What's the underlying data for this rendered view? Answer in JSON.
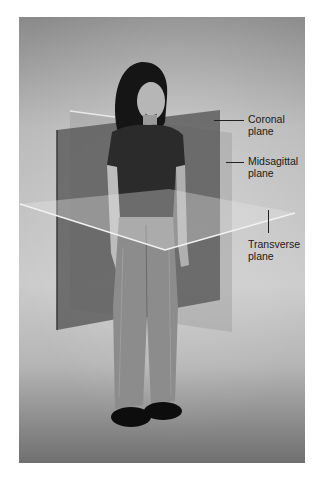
{
  "figure": {
    "labels": {
      "coronal": {
        "line1": "Coronal",
        "line2": "plane"
      },
      "midsagittal": {
        "line1": "Midsagittal",
        "line2": "plane"
      },
      "transverse": {
        "line1": "Transverse",
        "line2": "plane"
      }
    },
    "colors": {
      "background_top": "#8e8e8e",
      "background_mid": "#c4c4c4",
      "floor": "#7a7a7a",
      "coronal_plane": "#5c5c5c",
      "midsagittal_plane": "#9a9a9a",
      "transverse_plane": "#d8d8d8",
      "label_text": "#1a1a1a"
    }
  }
}
